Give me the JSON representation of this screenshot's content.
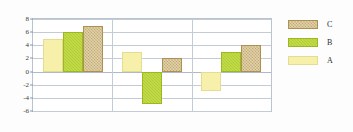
{
  "chart_data": {
    "type": "bar",
    "title": "",
    "subtitle": "",
    "xlabel": "",
    "ylabel": "",
    "categories": [
      "2002",
      "2003",
      "2004"
    ],
    "series": [
      {
        "name": "A",
        "values": [
          5,
          3,
          -3
        ],
        "color": "#f6f0ab"
      },
      {
        "name": "B",
        "values": [
          6,
          -5,
          3
        ],
        "color": "#b2d027"
      },
      {
        "name": "C",
        "values": [
          7,
          2,
          4
        ],
        "color": "#c3a766"
      }
    ],
    "ylim": [
      -6,
      8
    ],
    "yticks": [
      8,
      6,
      4,
      2,
      0,
      -2,
      -4,
      -6
    ],
    "ytick_labels": [
      "8",
      "6",
      "4",
      "2",
      "0",
      "-2",
      "-4",
      "-6"
    ],
    "grid": true,
    "grid_axis": "y",
    "legend": {
      "position": "right",
      "order": [
        "C",
        "B",
        "A"
      ],
      "entries": [
        {
          "label": "C",
          "color": "#c3a766"
        },
        {
          "label": "B",
          "color": "#b2d027"
        },
        {
          "label": "A",
          "color": "#f6f0ab"
        }
      ]
    },
    "colors": {
      "grid": "#c3ccd6",
      "axis": "#b9c4cf",
      "text": "#2e2e2e",
      "background": "#ffffff"
    }
  }
}
